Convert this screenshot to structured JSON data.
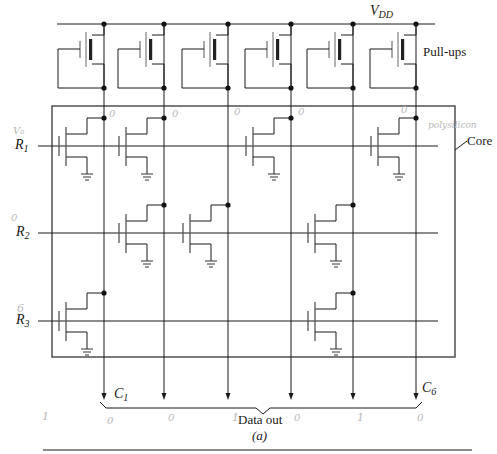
{
  "figure": {
    "caption": "(a)",
    "supply_label": "V",
    "supply_sub": "DD",
    "pullups_label": "Pull-ups",
    "core_label": "Core",
    "data_out_label": "Data out",
    "rows": [
      {
        "label": "R",
        "sub": "1",
        "y": 146
      },
      {
        "label": "R",
        "sub": "2",
        "y": 233
      },
      {
        "label": "R",
        "sub": "3",
        "y": 321
      }
    ],
    "columns": [
      {
        "label": "C",
        "sub": "1",
        "x": 104
      },
      {
        "label": "",
        "sub": "",
        "x": 164
      },
      {
        "label": "",
        "sub": "",
        "x": 228
      },
      {
        "label": "",
        "sub": "",
        "x": 291
      },
      {
        "label": "",
        "sub": "",
        "x": 353
      },
      {
        "label": "C",
        "sub": "6",
        "x": 416
      }
    ],
    "column_first_label": {
      "text": "C",
      "sub": "1"
    },
    "column_last_label": {
      "text": "C",
      "sub": "6"
    },
    "transistors": [
      {
        "row": 0,
        "col": 0
      },
      {
        "row": 0,
        "col": 1
      },
      {
        "row": 0,
        "col": 3
      },
      {
        "row": 0,
        "col": 5
      },
      {
        "row": 1,
        "col": 1
      },
      {
        "row": 1,
        "col": 2
      },
      {
        "row": 1,
        "col": 4
      },
      {
        "row": 2,
        "col": 0
      },
      {
        "row": 2,
        "col": 4
      }
    ]
  },
  "handwritten": {
    "row1_note": "V₀",
    "row2_note": "0",
    "row3_note": "6",
    "polysilicon_note": "polysilicon",
    "core_bits_row1": [
      "0",
      "0",
      "0",
      "",
      "0",
      "0"
    ],
    "output_bits": [
      "1",
      "0",
      "0",
      "1",
      "0",
      "1",
      "0"
    ]
  }
}
